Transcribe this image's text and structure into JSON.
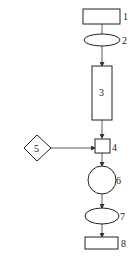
{
  "diagram": {
    "type": "flowchart",
    "nodes": [
      {
        "id": "1",
        "label": "1",
        "shape": "rectangle"
      },
      {
        "id": "2",
        "label": "2",
        "shape": "ellipse"
      },
      {
        "id": "3",
        "label": "3",
        "shape": "tall-rectangle"
      },
      {
        "id": "4",
        "label": "4",
        "shape": "square"
      },
      {
        "id": "5",
        "label": "5",
        "shape": "diamond"
      },
      {
        "id": "6",
        "label": "6",
        "shape": "circle"
      },
      {
        "id": "7",
        "label": "7",
        "shape": "ellipse"
      },
      {
        "id": "8",
        "label": "8",
        "shape": "rectangle"
      }
    ],
    "edges": [
      {
        "from": "1",
        "to": "2",
        "arrow": false
      },
      {
        "from": "2",
        "to": "3",
        "arrow": true
      },
      {
        "from": "3",
        "to": "4",
        "arrow": true
      },
      {
        "from": "5",
        "to": "4",
        "arrow": true
      },
      {
        "from": "4",
        "to": "6",
        "arrow": true
      },
      {
        "from": "6",
        "to": "7",
        "arrow": true
      },
      {
        "from": "7",
        "to": "8",
        "arrow": true
      }
    ],
    "colors": {
      "stroke": "#222222",
      "background": "#ffffff"
    }
  }
}
